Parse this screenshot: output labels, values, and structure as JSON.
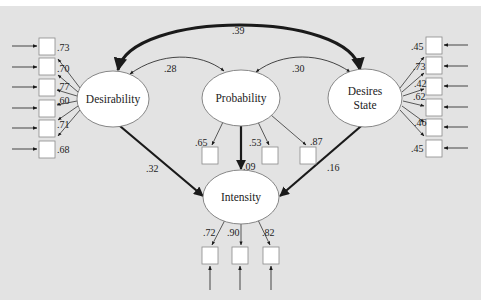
{
  "colors": {
    "page_background": "#ffffff",
    "panel_background": "#e3e3e3",
    "node_fill": "#ffffff",
    "node_stroke": "#7a7a7a",
    "edge": "#1a1a1a",
    "text": "#222222"
  },
  "latent_nodes": {
    "desirability": {
      "label": "Desirability"
    },
    "probability": {
      "label": "Probability"
    },
    "desires_state": {
      "label_line1": "Desires",
      "label_line2": "State"
    },
    "intensity": {
      "label": "Intensity"
    }
  },
  "covariances": {
    "desirability_desires_state": ".39",
    "desirability_probability": ".28",
    "probability_desires_state": ".30"
  },
  "paths": {
    "desirability_to_intensity": ".32",
    "probability_to_intensity": ".09",
    "desires_state_to_intensity": ".16"
  },
  "loadings": {
    "desirability": [
      ".73",
      ".70",
      ".77",
      ".60",
      ".71",
      ".68"
    ],
    "desires_state": [
      ".45",
      ".73",
      ".42",
      ".62",
      ".46",
      ".45"
    ],
    "probability": [
      ".65",
      ".53",
      ".87"
    ],
    "intensity": [
      ".72",
      ".90",
      ".82"
    ]
  }
}
